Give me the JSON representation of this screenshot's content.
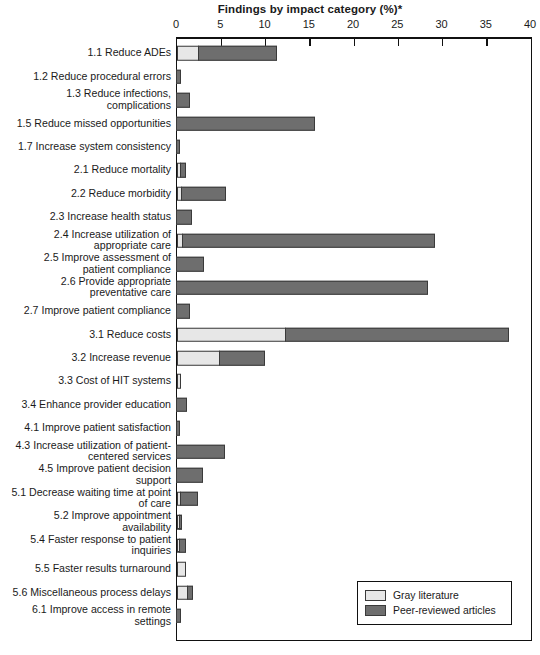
{
  "chart_data": {
    "type": "bar",
    "orientation": "horizontal",
    "stacked": true,
    "title": "Findings by impact category (%)*",
    "xlabel": "",
    "ylabel": "",
    "xlim": [
      0,
      40
    ],
    "xticks": [
      0,
      5,
      10,
      15,
      20,
      25,
      30,
      35,
      40
    ],
    "grid": false,
    "legend_position": "bottom-right",
    "colors": {
      "gray_literature": "#e7e7e7",
      "peer_reviewed": "#6e6e6e",
      "outline": "#3a3a3a",
      "axis": "#111111"
    },
    "series": [
      {
        "name": "Gray literature",
        "values": [
          2.5,
          0.0,
          0.0,
          0.0,
          0.0,
          0.5,
          0.6,
          0.0,
          0.7,
          0.0,
          0.0,
          0.0,
          12.3,
          4.9,
          0.4,
          0.0,
          0.0,
          0.0,
          0.0,
          0.5,
          0.3,
          0.3,
          1.0,
          1.2,
          0.0
        ]
      },
      {
        "name": "Peer-reviewed articles",
        "values": [
          8.9,
          0.6,
          1.6,
          15.7,
          0.5,
          0.6,
          5.0,
          1.8,
          28.6,
          3.2,
          28.5,
          1.6,
          25.3,
          5.2,
          0.0,
          1.2,
          0.4,
          5.5,
          3.1,
          2.0,
          0.4,
          0.8,
          0.0,
          0.7,
          0.6
        ]
      }
    ],
    "categories": [
      "1.1 Reduce ADEs",
      "1.2 Reduce procedural errors",
      "1.3 Reduce infections,\ncomplications",
      "1.5 Reduce missed opportunities",
      "1.7 Increase system consistency",
      "2.1 Reduce mortality",
      "2.2 Reduce morbidity",
      "2.3 Increase health status",
      "2.4 Increase utilization of\nappropriate care",
      "2.5 Improve assessment of\npatient compliance",
      "2.6 Provide appropriate\npreventative care",
      "2.7 Improve patient compliance",
      "3.1 Reduce costs",
      "3.2 Increase revenue",
      "3.3 Cost of HIT systems",
      "3.4 Enhance provider education",
      "4.1 Improve patient satisfaction",
      "4.3 Increase utilization of patient-\ncentered services",
      "4.5 Improve patient decision\nsupport",
      "5.1 Decrease waiting time at point\nof care",
      "5.2 Improve appointment\navailability",
      "5.4 Faster response to patient\ninquiries",
      "5.5 Faster results turnaround",
      "5.6 Miscellaneous process delays",
      "6.1 Improve access in remote\nsettings"
    ],
    "totals": [
      11.4,
      0.6,
      1.6,
      15.7,
      0.5,
      1.1,
      5.6,
      1.8,
      29.3,
      3.2,
      28.5,
      1.6,
      37.6,
      10.1,
      0.4,
      1.2,
      0.4,
      5.5,
      3.1,
      2.5,
      0.7,
      1.1,
      1.0,
      1.9,
      0.6
    ]
  },
  "legend": {
    "items": [
      {
        "label": "Gray literature",
        "color": "#e7e7e7"
      },
      {
        "label": "Peer-reviewed articles",
        "color": "#6e6e6e"
      }
    ]
  }
}
